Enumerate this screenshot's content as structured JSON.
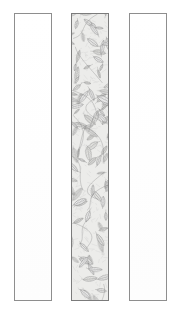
{
  "artwork": {
    "title": "Three vertical decorative panels",
    "description": "Line-art illustration of three tall narrow rectangular panels; the outer two are blank and the central panel is filled with a dense overlapping leaf and foliage pattern.",
    "background_color": "#ffffff",
    "canvas": {
      "width": 179,
      "height": 322
    }
  },
  "panels": [
    {
      "id": "left-panel",
      "label": "Left blank panel",
      "fill": "blank",
      "x": 14,
      "y": 13,
      "width": 38,
      "height": 288,
      "border_color": "#8e8e8e",
      "fill_color": "#ffffff"
    },
    {
      "id": "center-panel",
      "label": "Center foliage panel",
      "fill": "leaf-pattern",
      "x": 71,
      "y": 13,
      "width": 38,
      "height": 288,
      "border_color": "#7b7b7b",
      "fill_color": "#f3f3f1",
      "pattern": {
        "name": "overlapping-leaves",
        "motif": "elongated ovate leaves with central midrib, lateral veins and fine hatching",
        "line_color": "#6f6f6f",
        "vein_color": "#8a8a8a",
        "hatch_color": "#a8a8a8",
        "density": "dense",
        "leaf_count": 96
      }
    },
    {
      "id": "right-panel",
      "label": "Right blank panel",
      "fill": "blank",
      "x": 129,
      "y": 13,
      "width": 38,
      "height": 288,
      "border_color": "#8e8e8e",
      "fill_color": "#ffffff"
    }
  ],
  "colors": {
    "border_gray": "#8e8e8e",
    "pattern_line": "#6f6f6f",
    "pattern_bg": "#f3f3f1",
    "page_bg": "#ffffff"
  }
}
